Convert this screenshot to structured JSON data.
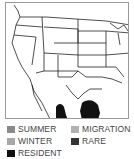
{
  "map": {
    "region": "western North America range map",
    "range_fill": "#111111"
  },
  "legend": {
    "items": [
      {
        "key": "summer",
        "label": "SUMMER",
        "color": "#8a8a8a"
      },
      {
        "key": "migration",
        "label": "MIGRATION",
        "color": "#b0b0b0"
      },
      {
        "key": "winter",
        "label": "WINTER",
        "color": "#a8a8a8"
      },
      {
        "key": "rare",
        "label": "RARE",
        "color": "#333333"
      },
      {
        "key": "resident",
        "label": "RESIDENT",
        "color": "#111111"
      }
    ]
  }
}
